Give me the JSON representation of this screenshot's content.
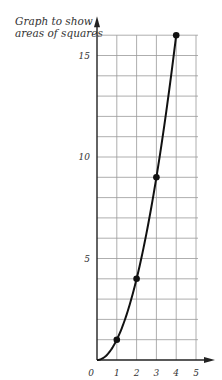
{
  "chart_data": {
    "type": "line",
    "title": "Graph to show areas of squares",
    "title_lines": [
      "Graph to show",
      "areas of squares"
    ],
    "xlabel": "",
    "ylabel": "",
    "x": [
      0,
      1,
      2,
      3,
      4
    ],
    "series": [
      {
        "name": "area",
        "values": [
          0,
          1,
          4,
          9,
          16
        ]
      }
    ],
    "points_marked": [
      [
        1,
        1
      ],
      [
        2,
        4
      ],
      [
        3,
        9
      ],
      [
        4,
        16
      ]
    ],
    "xlim": [
      0,
      5
    ],
    "ylim": [
      0,
      16
    ],
    "x_ticks": [
      "0",
      "1",
      "2",
      "3",
      "4",
      "5"
    ],
    "y_ticks": [
      "5",
      "10",
      "15"
    ],
    "grid": true,
    "legend": null
  }
}
